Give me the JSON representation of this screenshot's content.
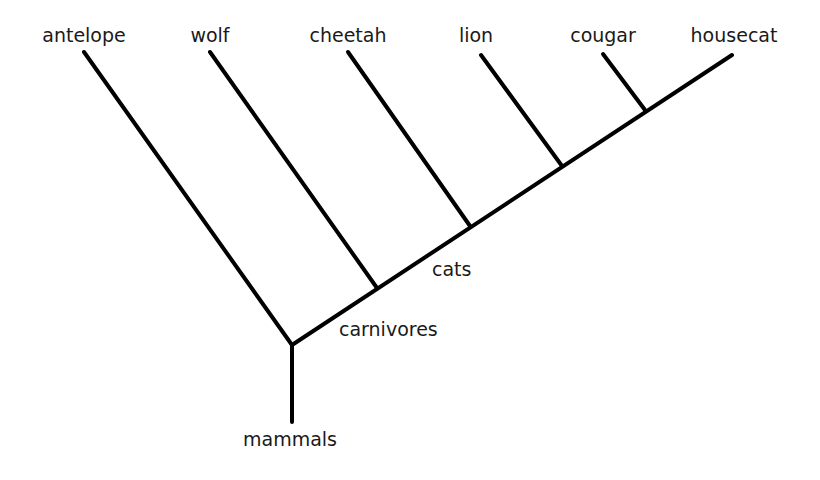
{
  "diagram": {
    "type": "cladogram",
    "line_color": "#000000",
    "leaves": [
      {
        "id": "antelope",
        "label": "antelope",
        "x": 84,
        "y": 52,
        "lx": 84,
        "ly": 26
      },
      {
        "id": "wolf",
        "label": "wolf",
        "x": 210,
        "y": 52,
        "lx": 210,
        "ly": 26
      },
      {
        "id": "cheetah",
        "label": "cheetah",
        "x": 348,
        "y": 52,
        "lx": 348,
        "ly": 26
      },
      {
        "id": "lion",
        "label": "lion",
        "x": 481,
        "y": 55,
        "lx": 476,
        "ly": 26
      },
      {
        "id": "cougar",
        "label": "cougar",
        "x": 603,
        "y": 54,
        "lx": 603,
        "ly": 26
      },
      {
        "id": "housecat",
        "label": "housecat",
        "x": 732,
        "y": 55,
        "lx": 734,
        "ly": 26
      }
    ],
    "nodes": [
      {
        "id": "root",
        "x": 292,
        "y": 345
      },
      {
        "id": "wolf_junction",
        "x": 377,
        "y": 288
      },
      {
        "id": "cheetah_junction",
        "x": 470,
        "y": 226
      },
      {
        "id": "lion_junction",
        "x": 562,
        "y": 166
      },
      {
        "id": "cougar_junction",
        "x": 645,
        "y": 110
      }
    ],
    "stem": {
      "x": 292,
      "y_top": 345,
      "y_bottom": 422
    },
    "clade_labels": [
      {
        "id": "mammals",
        "label": "mammals",
        "x": 243,
        "y": 430
      },
      {
        "id": "carnivores",
        "label": "carnivores",
        "x": 339,
        "y": 320
      },
      {
        "id": "cats",
        "label": "cats",
        "x": 432,
        "y": 260
      }
    ]
  }
}
